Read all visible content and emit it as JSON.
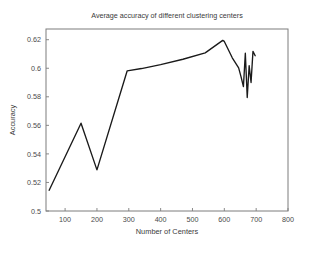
{
  "chart_data": {
    "type": "line",
    "title": "Average accuracy of different clustering centers",
    "xlabel": "Number of Centers",
    "ylabel": "Accuracy",
    "xlim": [
      40,
      800
    ],
    "ylim": [
      0.5,
      0.6275
    ],
    "grid": false,
    "legend": null,
    "xticks": [
      100,
      200,
      300,
      400,
      500,
      600,
      700,
      800
    ],
    "xticklabels": [
      "100",
      "200",
      "300",
      "400",
      "500",
      "600",
      "700",
      "800"
    ],
    "yticks": [
      0.5,
      0.52,
      0.54,
      0.56,
      0.58,
      0.6,
      0.62
    ],
    "yticklabels": [
      "0.5",
      "0.52",
      "0.54",
      "0.56",
      "0.58",
      "0.6",
      "0.62"
    ],
    "series": [
      {
        "name": "Average accuracy",
        "color": "#1a1a1a",
        "x": [
          50,
          150,
          200,
          295,
          340,
          400,
          470,
          540,
          595,
          600,
          625,
          645,
          652,
          660,
          666,
          672,
          678,
          684,
          690,
          697
        ],
        "y": [
          0.5145,
          0.5615,
          0.5288,
          0.5982,
          0.5998,
          0.6025,
          0.6063,
          0.6108,
          0.6195,
          0.6188,
          0.6073,
          0.6003,
          0.5945,
          0.5872,
          0.6105,
          0.5795,
          0.6018,
          0.59,
          0.6118,
          0.6088
        ]
      }
    ]
  },
  "axis_geometry": {
    "plot_left": 46,
    "plot_right": 288,
    "plot_top": 29,
    "plot_bottom": 211
  }
}
